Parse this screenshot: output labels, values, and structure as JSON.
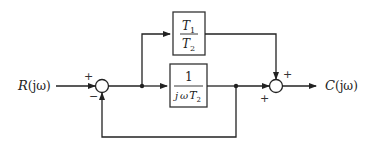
{
  "diagram": {
    "type": "control-system-block-diagram",
    "input": {
      "label": "R(jω)",
      "label_main": "R",
      "label_arg": "(jω)"
    },
    "output": {
      "label": "C(jω)",
      "label_main": "C",
      "label_arg": "(jω)"
    },
    "blocks": [
      {
        "id": "feedforward",
        "numerator": "T₁",
        "denominator": "T₂",
        "num_main": "T",
        "num_sub": "1",
        "den_main": "T",
        "den_sub": "2"
      },
      {
        "id": "integrator",
        "numerator": "1",
        "denominator": "jωT₂",
        "den_j": "j",
        "den_omega": "ω",
        "den_main": "T",
        "den_sub": "2"
      }
    ],
    "summing_junctions": [
      {
        "id": "sum1",
        "signs": {
          "left": "+",
          "bottom": "−"
        }
      },
      {
        "id": "sum2",
        "signs": {
          "top": "+",
          "left": "+"
        }
      }
    ],
    "sign_plus": "+",
    "sign_minus": "−",
    "line_color": "#222222"
  }
}
